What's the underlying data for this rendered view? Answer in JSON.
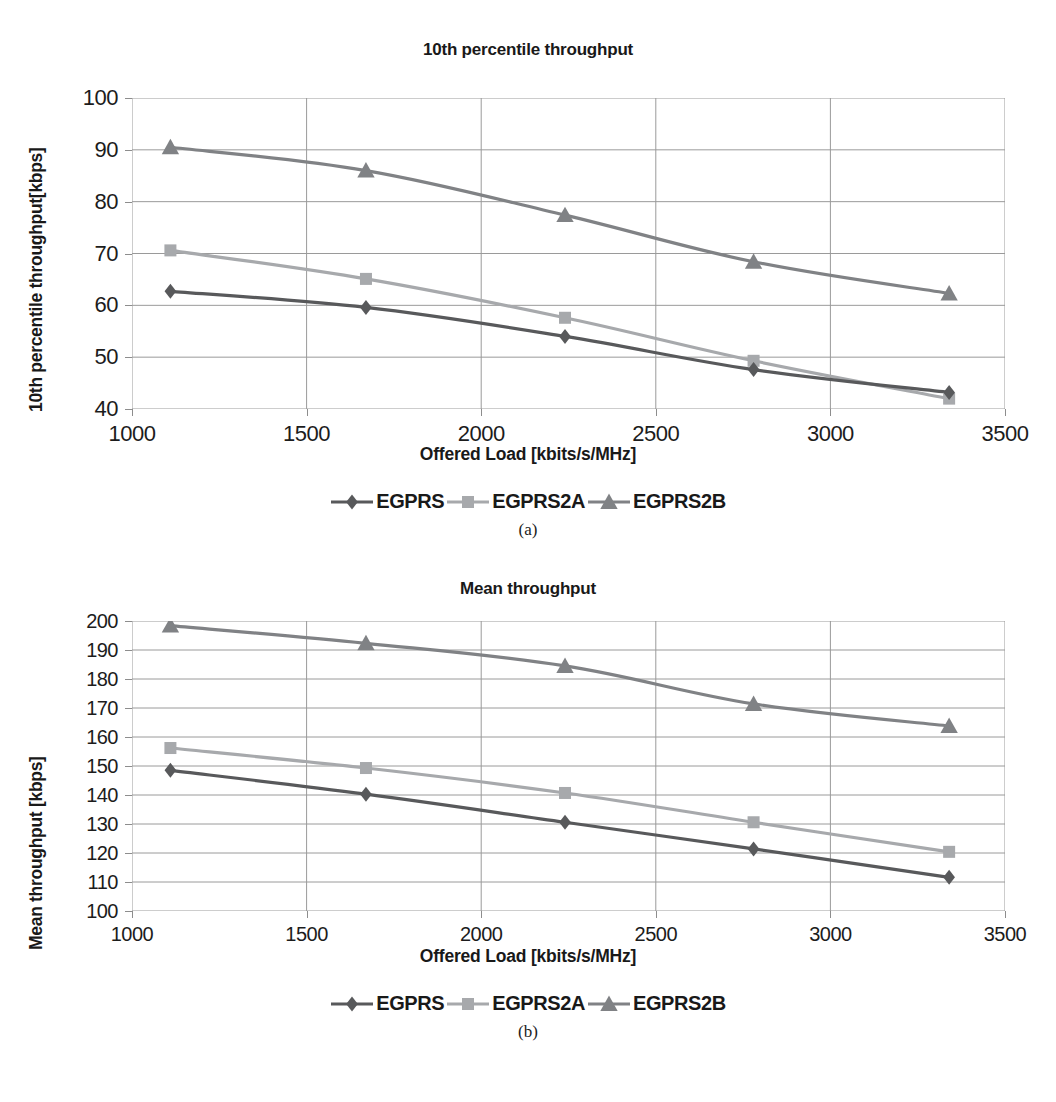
{
  "figure": {
    "panels": [
      {
        "id": "a",
        "subcaption": "(a)",
        "title": "10th percentile throughput",
        "ylabel": "10th percentile throughput[kbps]",
        "xlabel": "Offered Load [kbits/s/MHz]",
        "legend": [
          {
            "label": "EGPRS",
            "marker": "diamond-marker",
            "color": "#58595b"
          },
          {
            "label": "EGPRS2A",
            "marker": "square-marker",
            "color": "#a7a9ac"
          },
          {
            "label": "EGPRS2B",
            "marker": "triangle-marker",
            "color": "#808285"
          }
        ]
      },
      {
        "id": "b",
        "subcaption": "(b)",
        "title": "Mean throughput",
        "ylabel": "Mean throughput [kbps]",
        "xlabel": "Offered Load [kbits/s/MHz]",
        "legend": [
          {
            "label": "EGPRS",
            "marker": "diamond-marker",
            "color": "#58595b"
          },
          {
            "label": "EGPRS2A",
            "marker": "square-marker",
            "color": "#a7a9ac"
          },
          {
            "label": "EGPRS2B",
            "marker": "triangle-marker",
            "color": "#808285"
          }
        ]
      }
    ]
  },
  "chart_data": [
    {
      "type": "line",
      "panel": "a",
      "title": "10th percentile throughput",
      "xlabel": "Offered Load [kbits/s/MHz]",
      "ylabel": "10th percentile throughput[kbps]",
      "x": [
        1110,
        1670,
        2240,
        2780,
        3340
      ],
      "xlim": [
        1000,
        3500
      ],
      "ylim": [
        40,
        100
      ],
      "xticks": [
        1000,
        1500,
        2000,
        2500,
        3000,
        3500
      ],
      "yticks": [
        40,
        50,
        60,
        70,
        80,
        90,
        100
      ],
      "grid": "both",
      "legend_position": "below-axis",
      "series": [
        {
          "name": "EGPRS",
          "marker": "diamond",
          "color": "#58595b",
          "values": [
            62.7,
            59.6,
            54.0,
            47.6,
            43.2
          ]
        },
        {
          "name": "EGPRS2A",
          "marker": "square",
          "color": "#a7a9ac",
          "values": [
            70.6,
            65.1,
            57.6,
            49.3,
            42.0
          ]
        },
        {
          "name": "EGPRS2B",
          "marker": "triangle",
          "color": "#808285",
          "values": [
            90.5,
            86.0,
            77.4,
            68.4,
            62.3
          ]
        }
      ]
    },
    {
      "type": "line",
      "panel": "b",
      "title": "Mean throughput",
      "xlabel": "Offered Load [kbits/s/MHz]",
      "ylabel": "Mean throughput [kbps]",
      "x": [
        1110,
        1670,
        2240,
        2780,
        3340
      ],
      "xlim": [
        1000,
        3500
      ],
      "ylim": [
        100,
        200
      ],
      "xticks": [
        1000,
        1500,
        2000,
        2500,
        3000,
        3500
      ],
      "yticks": [
        100,
        110,
        120,
        130,
        140,
        150,
        160,
        170,
        180,
        190,
        200
      ],
      "grid": "both",
      "legend_position": "below-axis",
      "series": [
        {
          "name": "EGPRS",
          "marker": "diamond",
          "color": "#58595b",
          "values": [
            148.5,
            140.3,
            130.6,
            121.4,
            111.6
          ]
        },
        {
          "name": "EGPRS2A",
          "marker": "square",
          "color": "#a7a9ac",
          "values": [
            156.2,
            149.3,
            140.7,
            130.6,
            120.4
          ]
        },
        {
          "name": "EGPRS2B",
          "marker": "triangle",
          "color": "#808285",
          "values": [
            198.4,
            192.3,
            184.5,
            171.4,
            163.8
          ]
        }
      ]
    }
  ]
}
